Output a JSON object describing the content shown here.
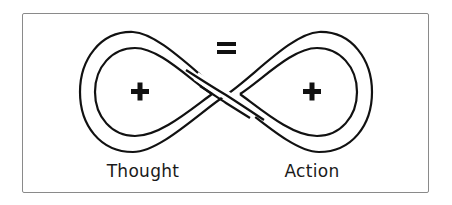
{
  "diagram": {
    "left_label": "Thought",
    "right_label": "Action",
    "left_symbol": "plus",
    "right_symbol": "plus",
    "center_symbol": "equals",
    "shape": "infinity-loop",
    "stroke_color": "#111111",
    "frame_color": "#8a8a8a"
  }
}
